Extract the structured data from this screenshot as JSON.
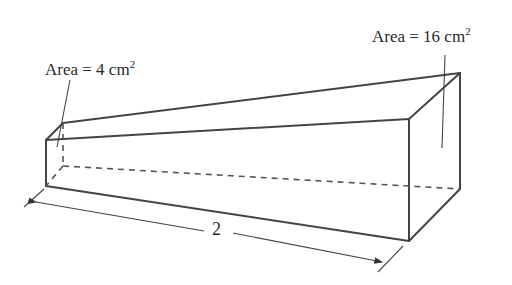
{
  "diagram": {
    "type": "truncated pyramid / frustum-like solid with rectangular cross-sections",
    "labels": {
      "left_area": {
        "prefix": "Area = 4 cm",
        "exp": "2"
      },
      "right_area": {
        "prefix": "Area = 16 cm",
        "exp": "2"
      },
      "length": "2"
    },
    "colors": {
      "line": "#444444",
      "text": "#2a2a2a",
      "background": "#ffffff"
    }
  }
}
